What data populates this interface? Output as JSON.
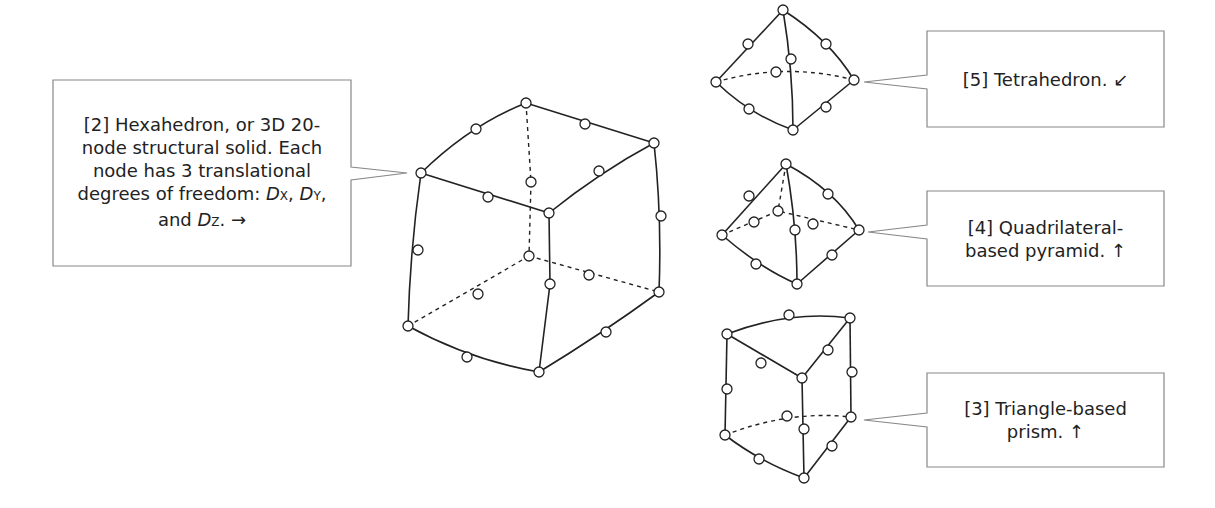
{
  "callouts": {
    "hexahedron": {
      "lines": [
        "[2] Hexahedron, or 3D 20-",
        "node structural solid.  Each",
        "node has 3 translational",
        "degrees of freedom: ",
        "and "
      ],
      "dof": {
        "dx": "D",
        "dx_sub": "X",
        "dy": "D",
        "dy_sub": "Y",
        "dz": "D",
        "dz_sub": "Z"
      },
      "arrow": "→",
      "sep": ", ",
      "end": ". "
    },
    "tetrahedron": {
      "lines": [
        "[5] Tetrahedron.  ↙"
      ]
    },
    "pyramid": {
      "lines": [
        "[4] Quadrilateral-",
        "based pyramid.  ↑"
      ]
    },
    "prism": {
      "lines": [
        "[3] Triangle-based",
        "prism.  ↑"
      ]
    }
  },
  "colors": {
    "stroke": "#222222",
    "box_border": "#888888",
    "node_fill": "#ffffff"
  },
  "shapes": [
    "hexahedron",
    "tetrahedron",
    "pyramid",
    "prism"
  ]
}
